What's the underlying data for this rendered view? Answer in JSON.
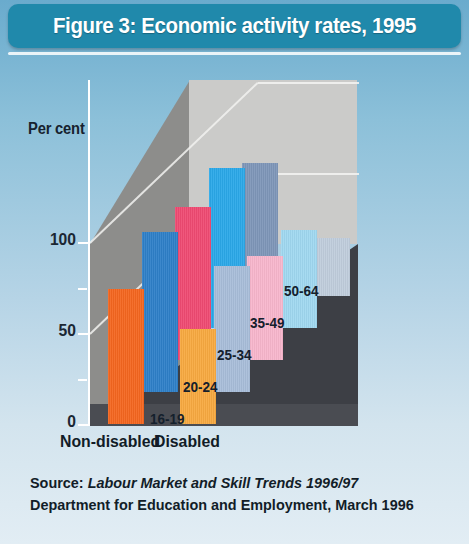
{
  "title": "Figure 3: Economic activity rates, 1995",
  "axis": {
    "y_title": "Per cent",
    "ticks": [
      "100",
      "50",
      "0"
    ],
    "minor_ticks": [
      "75",
      "25"
    ]
  },
  "series_labels": [
    "Non-disabled",
    "Disabled"
  ],
  "depth_labels": [
    "16-19",
    "20-24",
    "25-34",
    "35-49",
    "50-64"
  ],
  "source": {
    "prefix": "Source: ",
    "italic": "Labour Market and Skill Trends 1996/97",
    "line2": "Department for Education and Employment, March 1996"
  },
  "colors": {
    "title_bar": "#2089ab",
    "background_top": "#6aabcd",
    "background_bottom": "#e2edf4",
    "wall_back": "#cbcbc9",
    "wall_side": "#8d8d8b",
    "floor": "#3d3f45",
    "axis": "#ffffff",
    "text": "#14202c"
  },
  "chart_data": {
    "type": "bar",
    "title": "Figure 3: Economic activity rates, 1995",
    "xlabel": "",
    "ylabel": "Per cent",
    "ylim": [
      0,
      100
    ],
    "yticks": [
      0,
      25,
      50,
      75,
      100
    ],
    "grid": true,
    "legend_position": "below-axis",
    "projection": "3d",
    "categories": [
      "16-19",
      "20-24",
      "25-34",
      "35-49",
      "50-64"
    ],
    "series": [
      {
        "name": "Non-disabled",
        "values": [
          74,
          88,
          84,
          88,
          73
        ],
        "colors": [
          "#f4661f",
          "#2e7fc8",
          "#ef4a72",
          "#2aa8e8",
          "#7e96b8"
        ]
      },
      {
        "name": "Disabled",
        "values": [
          52,
          69,
          57,
          54,
          32
        ],
        "colors": [
          "#f7a940",
          "#a8bdd9",
          "#f8b6cc",
          "#a0d8f0",
          "#c0cddc"
        ]
      }
    ]
  }
}
